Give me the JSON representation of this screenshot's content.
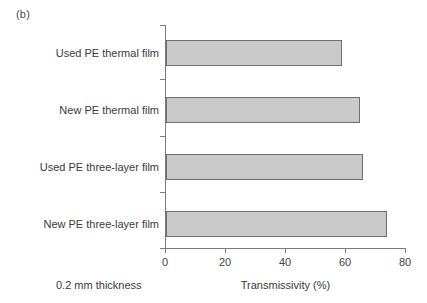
{
  "figure": {
    "panel_label": "(b)",
    "note": "0.2 mm thickness"
  },
  "chart_data": {
    "type": "bar",
    "orientation": "horizontal",
    "title": "",
    "xlabel": "Transmissivity (%)",
    "ylabel": "",
    "categories": [
      "Used PE thermal film",
      "New PE thermal film",
      "Used PE three-layer film",
      "New PE three-layer film"
    ],
    "values": [
      58.5,
      64.5,
      65.5,
      73.5
    ],
    "xlim": [
      0,
      80
    ],
    "xticks": [
      0,
      20,
      40,
      60,
      80
    ],
    "xtick_labels": [
      "0",
      "20",
      "40",
      "60",
      "80"
    ],
    "grid": false,
    "legend": false,
    "bar_fill_color": "#c9c9c9",
    "bar_edge_color": "#6f6f6f",
    "axis_color": "#7a7a7a"
  }
}
